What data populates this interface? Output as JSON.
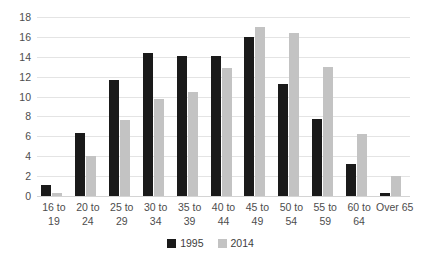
{
  "chart_data": {
    "type": "bar",
    "title": "",
    "xlabel": "",
    "ylabel": "",
    "ylim": [
      0,
      18
    ],
    "y_ticks": [
      0,
      2,
      4,
      6,
      8,
      10,
      12,
      14,
      16,
      18
    ],
    "grid": true,
    "legend_position": "bottom-center",
    "categories": [
      "16 to 19",
      "20 to 24",
      "25 to 29",
      "30 to 34",
      "35 to 39",
      "40 to 44",
      "45 to 49",
      "50 to 54",
      "55 to 59",
      "60 to 64",
      "Over 65"
    ],
    "category_lines": [
      [
        "16 to",
        "19"
      ],
      [
        "20 to",
        "24"
      ],
      [
        "25 to",
        "29"
      ],
      [
        "30 to",
        "34"
      ],
      [
        "35 to",
        "39"
      ],
      [
        "40 to",
        "44"
      ],
      [
        "45 to",
        "49"
      ],
      [
        "50 to",
        "54"
      ],
      [
        "55 to",
        "59"
      ],
      [
        "60 to",
        "64"
      ],
      [
        "Over 65",
        ""
      ]
    ],
    "series": [
      {
        "name": "1995",
        "color": "#1a1a1a",
        "values": [
          1.1,
          6.3,
          11.7,
          14.4,
          14.1,
          14.1,
          16.0,
          11.3,
          7.7,
          3.2,
          0.3
        ]
      },
      {
        "name": "2014",
        "color": "#c3c3c3",
        "values": [
          0.35,
          4.0,
          7.6,
          9.8,
          10.5,
          12.9,
          17.0,
          16.4,
          13.0,
          6.2,
          2.0
        ]
      }
    ]
  },
  "legend": {
    "items": [
      {
        "label": "1995",
        "color": "#1a1a1a"
      },
      {
        "label": "2014",
        "color": "#c3c3c3"
      }
    ]
  },
  "colors": {
    "series_1995": "#1a1a1a",
    "series_2014": "#c3c3c3",
    "gridline": "#e4e4e4",
    "text": "#4d4d4d",
    "background": "#ffffff"
  }
}
